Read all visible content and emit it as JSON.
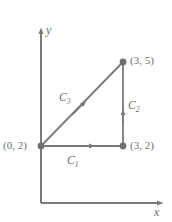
{
  "figure": {
    "type": "vector-line-diagram",
    "background_color": "#ffffff",
    "stroke_color": "#7a7a7a",
    "text_color": "#6f6f6f",
    "axes": {
      "x_label": "x",
      "y_label": "y",
      "x_axis_y_px": 203,
      "y_axis_x_px": 41,
      "arrows": [
        "up",
        "right"
      ]
    },
    "points": [
      {
        "id": "p-origin-vertex",
        "label": "(0, 2)",
        "x": 0,
        "y": 2,
        "px": 41,
        "py": 146
      },
      {
        "id": "p-bottom-right-vertex",
        "label": "(3, 2)",
        "x": 3,
        "y": 2,
        "px": 123,
        "py": 146
      },
      {
        "id": "p-top-right-vertex",
        "label": "(3, 5)",
        "x": 3,
        "y": 5,
        "px": 123,
        "py": 62
      }
    ],
    "curves": [
      {
        "id": "curve-c1",
        "label": "C",
        "subscript": "1",
        "description": "horizontal segment from (0, 2) to (3, 2)",
        "direction": "right"
      },
      {
        "id": "curve-c2",
        "label": "C",
        "subscript": "2",
        "description": "vertical segment from (3, 2) to (3, 5)",
        "direction": "up"
      },
      {
        "id": "curve-c3",
        "label": "C",
        "subscript": "3",
        "description": "diagonal segment from (0, 2) to (3, 5)",
        "direction": "up-right"
      }
    ]
  }
}
